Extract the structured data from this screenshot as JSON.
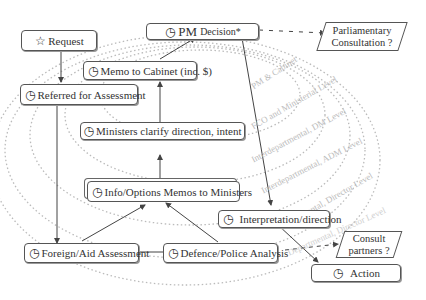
{
  "diagram": {
    "nodes": {
      "request": {
        "icon": "star-icon",
        "glyph": "☆",
        "label": "Request"
      },
      "referred": {
        "icon": "clock-icon",
        "glyph": "◷",
        "label": "Referred for Assessment"
      },
      "pm_decision": {
        "icon": "clock-icon",
        "glyph": "◷",
        "label_prefix": "PM",
        "label": "Decision*"
      },
      "memo_cabinet": {
        "icon": "clock-icon",
        "glyph": "◷",
        "label": "Memo to Cabinet (inc. $)"
      },
      "ministers_clarify": {
        "icon": "clock-icon",
        "glyph": "◷",
        "label": "Ministers clarify direction, intent"
      },
      "info_options": {
        "icon": "clock-icon",
        "glyph": "◷",
        "label": "Info/Options Memos to Ministers"
      },
      "foreign_aid": {
        "icon": "clock-icon",
        "glyph": "◷",
        "label": "Foreign/Aid Assessment"
      },
      "defence_police": {
        "icon": "clock-icon",
        "glyph": "◷",
        "label": "Defence/Police Analysis"
      },
      "interpretation": {
        "icon": "clock-icon",
        "glyph": "◷",
        "label": "Interpretation/direction"
      },
      "action": {
        "icon": "clock-icon",
        "glyph": "◷",
        "label": "Action"
      }
    },
    "decisions": {
      "parliamentary": {
        "line1": "Parliamentary",
        "line2": "Consultation ?"
      },
      "consult_partners": {
        "line1": "Consult",
        "line2": "partners ?"
      }
    },
    "ring_labels": [
      "PM & Cabinet",
      "FCO and Ministerial Level",
      "Interdepartmental, DM Level",
      "Interdepartmental, ADM Level",
      "Departmental, Director Level",
      "Departmental, Director Level"
    ],
    "colors": {
      "box_border": "#555555",
      "ring": "#bbbbbb",
      "arrow": "#444444"
    }
  }
}
